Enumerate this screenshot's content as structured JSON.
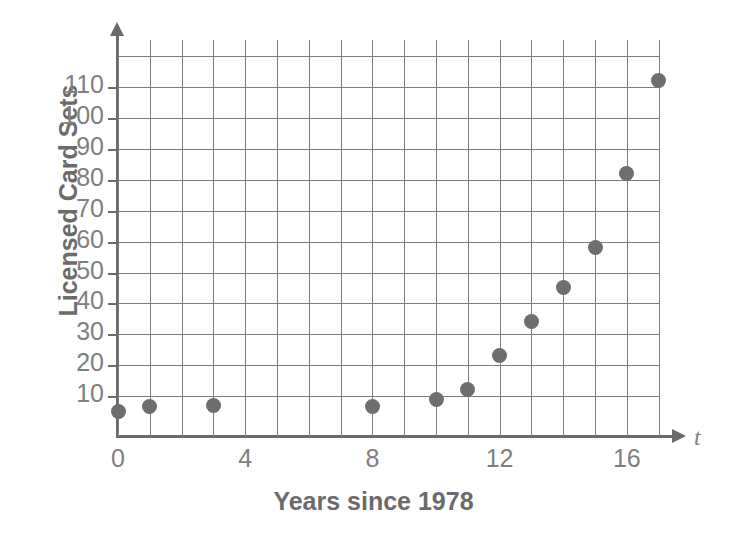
{
  "chart_data": {
    "type": "scatter",
    "title": "",
    "xlabel": "Years since 1978",
    "ylabel": "Licensed Card Sets",
    "x_axis_variable": "t",
    "xlim": [
      0,
      17.6
    ],
    "ylim": [
      0,
      120
    ],
    "xticks": [
      "0",
      "4",
      "8",
      "12",
      "16"
    ],
    "xtick_values": [
      0,
      4,
      8,
      12,
      16
    ],
    "yticks": [
      "10",
      "20",
      "30",
      "40",
      "50",
      "60",
      "70",
      "80",
      "90",
      "100",
      "110"
    ],
    "ytick_values": [
      10,
      20,
      30,
      40,
      50,
      60,
      70,
      80,
      90,
      100,
      110
    ],
    "grid": true,
    "grid_x_step": 1,
    "grid_y_step": 10,
    "legend": "none",
    "marker_color": "#6e6e6e",
    "axis_color": "#6b6b6b",
    "grid_color": "#7d7d7d",
    "label_color": "#808080",
    "x": [
      0,
      1,
      3,
      8,
      10,
      11,
      12,
      13,
      14,
      15,
      16,
      17
    ],
    "y": [
      5,
      6.5,
      7,
      6.5,
      9,
      12,
      23,
      34,
      45,
      58,
      82,
      112
    ],
    "points": [
      {
        "t": 0,
        "value": 5
      },
      {
        "t": 1,
        "value": 6.5
      },
      {
        "t": 3,
        "value": 7
      },
      {
        "t": 8,
        "value": 6.5
      },
      {
        "t": 10,
        "value": 9
      },
      {
        "t": 11,
        "value": 12
      },
      {
        "t": 12,
        "value": 23
      },
      {
        "t": 13,
        "value": 34
      },
      {
        "t": 14,
        "value": 45
      },
      {
        "t": 15,
        "value": 58
      },
      {
        "t": 16,
        "value": 82
      },
      {
        "t": 17,
        "value": 112
      }
    ]
  }
}
